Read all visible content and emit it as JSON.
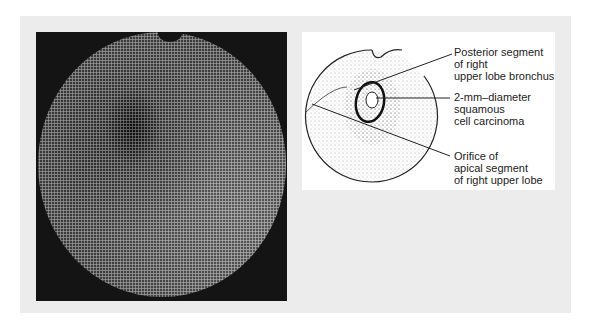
{
  "figure": {
    "photo": {
      "description": "fiberoptic bronchoscopy image"
    },
    "diagram": {
      "labels": [
        {
          "lines": [
            "Posterior segment",
            "of right",
            "upper lobe bronchus"
          ]
        },
        {
          "lines": [
            "2-mm–diameter",
            "squamous",
            "cell carcinoma"
          ]
        },
        {
          "lines": [
            "Orifice of",
            "apical segment",
            "of right upper lobe"
          ]
        }
      ]
    }
  }
}
